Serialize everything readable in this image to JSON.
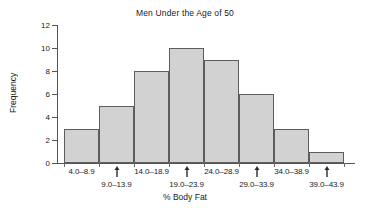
{
  "chart_data": {
    "type": "bar",
    "title": "Men Under the Age of 50",
    "xlabel": "% Body Fat",
    "ylabel": "Frequency",
    "categories": [
      "4.0–8.9",
      "9.0–13.9",
      "14.0–18.9",
      "19.0–23.9",
      "24.0–28.9",
      "29.0–33.9",
      "34.0–38.9",
      "39.0–43.9"
    ],
    "values": [
      3,
      5,
      8,
      10,
      9,
      6,
      3,
      1
    ],
    "ylim": [
      0,
      12
    ],
    "yticks": [
      0,
      2,
      4,
      6,
      8,
      10,
      12
    ],
    "ytick_labels": [
      "0",
      "2",
      "4",
      "6",
      "8",
      "10",
      "12"
    ],
    "grid": false,
    "legend": null,
    "bar_fill_color": "#d2d2d2",
    "bar_edge_color": "#5d5d5d",
    "axis_color": "#555555"
  },
  "label_rows": [
    0,
    1,
    0,
    1,
    0,
    1,
    0,
    1
  ]
}
